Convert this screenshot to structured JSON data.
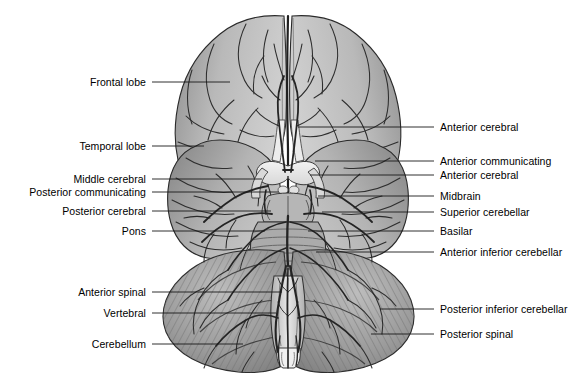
{
  "figure": {
    "background_color": "#ffffff",
    "line_color": "#1a1a1a",
    "text_color": "#000000",
    "width": 577,
    "height": 384
  },
  "labels_left": [
    {
      "text": "Frontal lobe",
      "text_x": 146,
      "text_y": 82,
      "line_x1": 152,
      "line_y1": 82,
      "line_x2": 230,
      "line_y2": 82
    },
    {
      "text": "Temporal lobe",
      "text_x": 146,
      "text_y": 146,
      "line_x1": 152,
      "line_y1": 146,
      "line_x2": 204,
      "line_y2": 146
    },
    {
      "text": "Middle cerebral",
      "text_x": 146,
      "text_y": 179,
      "line_x1": 152,
      "line_y1": 179,
      "line_x2": 262,
      "line_y2": 179
    },
    {
      "text": "Posterior communicating",
      "text_x": 146,
      "text_y": 192,
      "line_x1": 152,
      "line_y1": 192,
      "line_x2": 279,
      "line_y2": 192
    },
    {
      "text": "Posterior cerebral",
      "text_x": 146,
      "text_y": 211,
      "line_x1": 152,
      "line_y1": 211,
      "line_x2": 271,
      "line_y2": 211
    },
    {
      "text": "Pons",
      "text_x": 146,
      "text_y": 231,
      "line_x1": 152,
      "line_y1": 231,
      "line_x2": 265,
      "line_y2": 231
    },
    {
      "text": "Anterior spinal",
      "text_x": 146,
      "text_y": 292,
      "line_x1": 152,
      "line_y1": 292,
      "line_x2": 282,
      "line_y2": 292
    },
    {
      "text": "Vertebral",
      "text_x": 146,
      "text_y": 313,
      "line_x1": 152,
      "line_y1": 313,
      "line_x2": 276,
      "line_y2": 313
    },
    {
      "text": "Cerebellum",
      "text_x": 146,
      "text_y": 344,
      "line_x1": 152,
      "line_y1": 344,
      "line_x2": 243,
      "line_y2": 344
    }
  ],
  "labels_right": [
    {
      "text": "Anterior cerebral",
      "text_x": 440,
      "text_y": 127,
      "line_x1": 434,
      "line_y1": 127,
      "line_x2": 298,
      "line_y2": 127
    },
    {
      "text": "Anterior communicating",
      "text_x": 440,
      "text_y": 161,
      "line_x1": 434,
      "line_y1": 161,
      "line_x2": 315,
      "line_y2": 161
    },
    {
      "text": "Anterior cerebral",
      "text_x": 440,
      "text_y": 175,
      "line_x1": 434,
      "line_y1": 175,
      "line_x2": 310,
      "line_y2": 175
    },
    {
      "text": "Midbrain",
      "text_x": 440,
      "text_y": 196,
      "line_x1": 434,
      "line_y1": 196,
      "line_x2": 318,
      "line_y2": 196
    },
    {
      "text": "Superior cerebellar",
      "text_x": 440,
      "text_y": 212,
      "line_x1": 434,
      "line_y1": 212,
      "line_x2": 322,
      "line_y2": 212
    },
    {
      "text": "Basilar",
      "text_x": 440,
      "text_y": 231,
      "line_x1": 434,
      "line_y1": 231,
      "line_x2": 308,
      "line_y2": 231
    },
    {
      "text": "Anterior inferior cerebellar",
      "text_x": 440,
      "text_y": 252,
      "line_x1": 434,
      "line_y1": 252,
      "line_x2": 316,
      "line_y2": 252
    },
    {
      "text": "Posterior inferior cerebellar",
      "text_x": 440,
      "text_y": 309,
      "line_x1": 434,
      "line_y1": 309,
      "line_x2": 380,
      "line_y2": 309
    },
    {
      "text": "Posterior spinal",
      "text_x": 440,
      "text_y": 334,
      "line_x1": 434,
      "line_y1": 334,
      "line_x2": 371,
      "line_y2": 334
    }
  ],
  "anatomy": {
    "view": "inferior",
    "structures": [
      "frontal lobe",
      "temporal lobe",
      "optic chiasm",
      "midbrain",
      "pons",
      "medulla",
      "cerebellum"
    ],
    "arteries": [
      "anterior cerebral",
      "anterior communicating",
      "middle cerebral",
      "posterior communicating",
      "posterior cerebral",
      "superior cerebellar",
      "basilar",
      "anterior inferior cerebellar",
      "posterior inferior cerebellar",
      "vertebral",
      "anterior spinal",
      "posterior spinal"
    ]
  }
}
